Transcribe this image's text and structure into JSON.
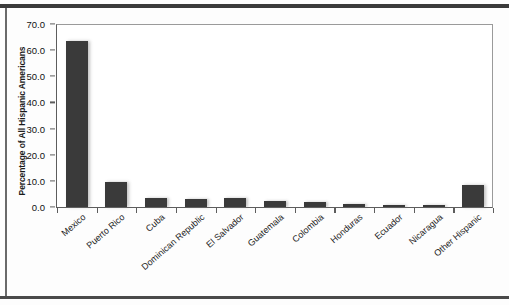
{
  "figure": {
    "title": "",
    "y_axis_title": "Percentage of All Hispanic Americans",
    "x_axis_title": "",
    "bar_color": "#3a3a3a",
    "axis_color": "#5d5d5d",
    "background_color": "#ffffff"
  },
  "chart_data": {
    "type": "bar",
    "title": "",
    "xlabel": "",
    "ylabel": "Percentage of All Hispanic Americans",
    "ylim": [
      0.0,
      70.0
    ],
    "ytick_labels": [
      "0.0",
      "10.0",
      "20.0",
      "30.0",
      "40.0",
      "50.0",
      "60.0",
      "70.0"
    ],
    "ytick_values": [
      0.0,
      10.0,
      20.0,
      30.0,
      40.0,
      50.0,
      60.0,
      70.0
    ],
    "grid": false,
    "legend": "none",
    "categories": [
      "Mexico",
      "Puerto Rico",
      "Cuba",
      "Dominican Republic",
      "El Salvador",
      "Guatemala",
      "Colombia",
      "Honduras",
      "Ecuador",
      "Nicaragua",
      "Other Hispanic"
    ],
    "values": [
      63.5,
      9.5,
      3.5,
      3.1,
      3.6,
      2.3,
      1.9,
      1.3,
      0.6,
      0.7,
      8.6
    ]
  }
}
